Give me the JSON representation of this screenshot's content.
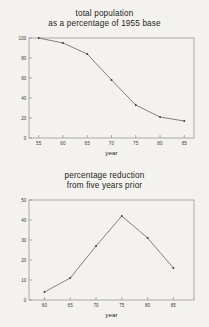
{
  "page": {
    "background_color": "#f3f2ee",
    "ink_color": "#3d3d3b",
    "frame_color": "#8e8d89",
    "line_color": "#5c5b58"
  },
  "figures": [
    {
      "name": "total-population-chart",
      "title_line1": "total population",
      "title_line2": "as a percentage of 1955 base"
    },
    {
      "name": "percentage-reduction-chart",
      "title_line1": "percentage reduction",
      "title_line2": "from five years prior"
    }
  ],
  "chart_data": [
    {
      "type": "line",
      "title": "total population as a percentage of 1955 base",
      "title_lines": [
        "total population",
        "as a percentage of 1955 base"
      ],
      "xlabel": "year",
      "ylabel": "",
      "x": [
        55,
        60,
        65,
        70,
        75,
        80,
        85
      ],
      "values": [
        100,
        95,
        84,
        58,
        33,
        21,
        17
      ],
      "xlim": [
        53,
        87
      ],
      "ylim": [
        0,
        100
      ],
      "xticks": [
        55,
        60,
        65,
        70,
        75,
        80,
        85
      ],
      "yticks": [
        0,
        20,
        40,
        60,
        80,
        100
      ],
      "xticklabels": [
        "55",
        "60",
        "65",
        "70",
        "75",
        "80",
        "85"
      ],
      "yticklabels": [
        "0",
        "20",
        "40",
        "60",
        "80",
        "100"
      ],
      "grid": false,
      "legend": false,
      "markers": true
    },
    {
      "type": "line",
      "title": "percentage reduction from five years prior",
      "title_lines": [
        "percentage reduction",
        "from five years prior"
      ],
      "xlabel": "year",
      "ylabel": "",
      "x": [
        60,
        65,
        70,
        75,
        80,
        85
      ],
      "values": [
        4,
        11,
        27,
        42,
        31,
        16
      ],
      "xlim": [
        57,
        89
      ],
      "ylim": [
        0,
        50
      ],
      "xticks": [
        60,
        65,
        70,
        75,
        80,
        85
      ],
      "yticks": [
        0,
        10,
        20,
        30,
        40,
        50
      ],
      "xticklabels": [
        "60",
        "65",
        "70",
        "75",
        "80",
        "85"
      ],
      "yticklabels": [
        "0",
        "10",
        "20",
        "30",
        "40",
        "50"
      ],
      "grid": false,
      "legend": false,
      "markers": true
    }
  ]
}
